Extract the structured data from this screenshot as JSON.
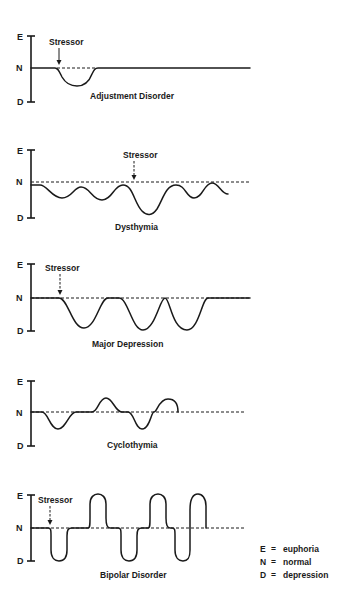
{
  "axis_letters": {
    "top": "E",
    "middle": "N",
    "bottom": "D"
  },
  "stressor_label": "Stressor",
  "panels": [
    {
      "id": "adjustment-disorder",
      "title": "Adjustment Disorder",
      "has_stressor": true
    },
    {
      "id": "dysthymia",
      "title": "Dysthymia",
      "has_stressor": true
    },
    {
      "id": "major-depression",
      "title": "Major Depression",
      "has_stressor": true
    },
    {
      "id": "cyclothymia",
      "title": "Cyclothymia",
      "has_stressor": false
    },
    {
      "id": "bipolar-disorder",
      "title": "Bipolar Disorder",
      "has_stressor": true
    }
  ],
  "legend": [
    {
      "key": "E",
      "eq": "=",
      "meaning": "euphoria"
    },
    {
      "key": "N",
      "eq": "=",
      "meaning": "normal"
    },
    {
      "key": "D",
      "eq": "=",
      "meaning": "depression"
    }
  ]
}
